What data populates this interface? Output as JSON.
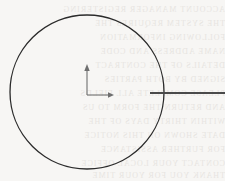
{
  "figure": {
    "background_color": "#f7f6f4",
    "width": 225,
    "height": 181
  },
  "circle": {
    "label": "circle",
    "center_x": 87,
    "center_y": 92,
    "radius": 77,
    "stroke_color": "#2b2b2b",
    "stroke_width": 1.3,
    "fill": "none"
  },
  "axes": {
    "label": "coordinate axes",
    "origin_x": 87,
    "origin_y": 95,
    "stroke_color": "#6f6f6f",
    "stroke_width": 1.1,
    "y_axis": {
      "label": "vertical axis arrow",
      "tip_x": 87,
      "tip_y": 65,
      "length": 30,
      "direction": "up"
    },
    "x_axis": {
      "label": "horizontal axis arrow",
      "tip_x": 114,
      "tip_y": 95,
      "length": 27,
      "direction": "right"
    },
    "arrow_head_length": 6,
    "arrow_head_width": 4
  },
  "radial_line": {
    "label": "horizontal line crossing circle boundary",
    "x_start": 150,
    "x_end": 225,
    "y": 93,
    "stroke_color": "#4a4a4a",
    "stroke_width": 2.0,
    "crosses_circle_at_x": 164
  },
  "paper_showthrough": {
    "label": "faint reversed text bleeding through the page",
    "color": "#cfcac4",
    "rows": [
      {
        "top": 6,
        "text": "ACCOUNT MANAGER REGISTERING"
      },
      {
        "top": 20,
        "text": "THE SYSTEM REQUIRES THE"
      },
      {
        "top": 34,
        "text": "FOLLOWING INFORMATION"
      },
      {
        "top": 48,
        "text": "NAME ADDRESS AND CODE"
      },
      {
        "top": 62,
        "text": "DETAILS OF THE CONTRACT"
      },
      {
        "top": 76,
        "text": "SIGNED BY BOTH PARTIES"
      },
      {
        "top": 90,
        "text": "PLEASE COMPLETE ALL FIELDS"
      },
      {
        "top": 104,
        "text": "AND RETURN THE FORM TO US"
      },
      {
        "top": 118,
        "text": "WITHIN THIRTY DAYS OF THE"
      },
      {
        "top": 132,
        "text": "DATE SHOWN ON THIS NOTICE"
      },
      {
        "top": 146,
        "text": "FOR FURTHER ASSISTANCE"
      },
      {
        "top": 160,
        "text": "CONTACT YOUR LOCAL OFFICE"
      },
      {
        "top": 172,
        "text": "THANK YOU FOR YOUR TIME"
      }
    ]
  }
}
